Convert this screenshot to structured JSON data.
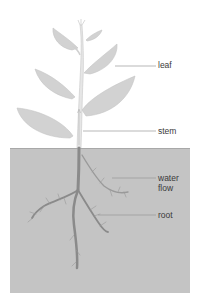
{
  "diagram": {
    "labels": {
      "leaf": "leaf",
      "stem": "stem",
      "water": "water",
      "flow": "flow",
      "root": "root"
    },
    "colors": {
      "background": "#ffffff",
      "soil": "#c4c4c4",
      "soil_edge": "#a8a8a8",
      "leaf_fill": "#d2d2d2",
      "leaf_edge": "#c2c2c2",
      "stem_fill": "#e6e6e6",
      "root": "#8a8a8a",
      "leader": "#9a9a9a",
      "text": "#3a3a3a"
    }
  }
}
